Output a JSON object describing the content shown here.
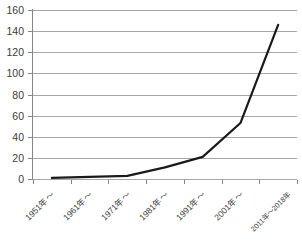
{
  "chart_data": {
    "type": "line",
    "title": "",
    "subtitle": "",
    "xlabel": "",
    "ylabel": "",
    "categories": [
      "1951年〜",
      "1961年〜",
      "1971年〜",
      "1981年〜",
      "1991年〜",
      "2001年〜",
      "2011年〜2018年"
    ],
    "series": [
      {
        "name": "",
        "values": [
          1,
          2,
          3,
          11,
          21,
          53,
          146
        ],
        "color": "#1a1a1a",
        "line_width": 2.2,
        "markers": false
      }
    ],
    "ylim": [
      0,
      160
    ],
    "ytick_step": 20,
    "ytick_labels": [
      "0",
      "20",
      "40",
      "60",
      "80",
      "100",
      "120",
      "140",
      "160"
    ],
    "grid": {
      "horizontal": true,
      "vertical": false,
      "color": "#a6a6a6"
    },
    "legend": {
      "visible": false,
      "position": "none"
    },
    "axis": {
      "y_axis_line_color": "#868686",
      "x_axis_line_color": "#868686",
      "tick_color": "#868686",
      "label_color": "#3b3b3b"
    },
    "background_color": "#ffffff",
    "xtick_label_rotation_deg": -45
  }
}
